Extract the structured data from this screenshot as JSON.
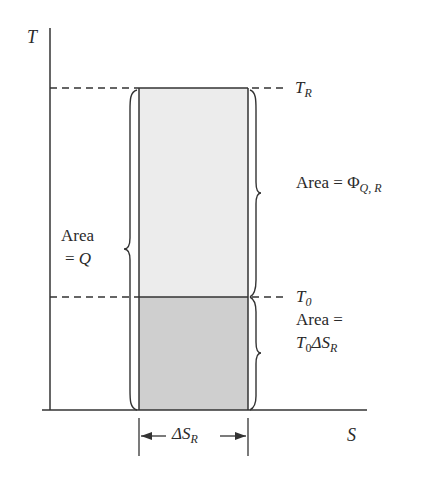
{
  "diagram": {
    "type": "T-S diagram",
    "axes": {
      "y_label": "T",
      "x_label": "S"
    },
    "levels": [
      {
        "name": "T_R",
        "symbol": "T",
        "subscript": "R"
      },
      {
        "name": "T_0",
        "symbol": "T",
        "subscript": "0"
      }
    ],
    "regions": [
      {
        "name": "upper",
        "fill": "#ececec",
        "label_prefix": "Area = ",
        "label_symbol": "Φ",
        "label_subscript": "Q, R"
      },
      {
        "name": "lower",
        "fill": "#cfcfcf",
        "label_line1": "Area =",
        "label_symbol": "T",
        "label_sub0": "0",
        "label_delta": "ΔS",
        "label_sub1": "R"
      }
    ],
    "left_brace": {
      "line1": "Area",
      "line2_prefix": "= ",
      "line2_symbol": "Q"
    },
    "width_marker": {
      "delta": "ΔS",
      "subscript": "R"
    }
  }
}
